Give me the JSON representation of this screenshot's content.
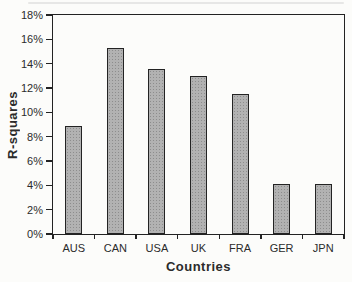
{
  "figure": {
    "background": "#fcfcfa",
    "axis_color": "#232323",
    "bar_fill": "#b2b2b2",
    "bar_dot_color": "#8d8d8d",
    "bar_border": "#232323",
    "text_color": "#2b2b2b"
  },
  "chart_data": {
    "type": "bar",
    "categories": [
      "AUS",
      "CAN",
      "USA",
      "UK",
      "FRA",
      "GER",
      "JPN"
    ],
    "values": [
      8.9,
      15.3,
      13.6,
      13.0,
      11.5,
      4.1,
      4.1
    ],
    "xlabel": "Countries",
    "ylabel": "R-squares",
    "ylim": [
      0,
      18
    ],
    "ytick_step": 2,
    "ytick_labels": [
      "0%",
      "2%",
      "4%",
      "6%",
      "8%",
      "10%",
      "12%",
      "14%",
      "16%",
      "18%"
    ],
    "unit": "%",
    "grid": false,
    "legend": null
  }
}
